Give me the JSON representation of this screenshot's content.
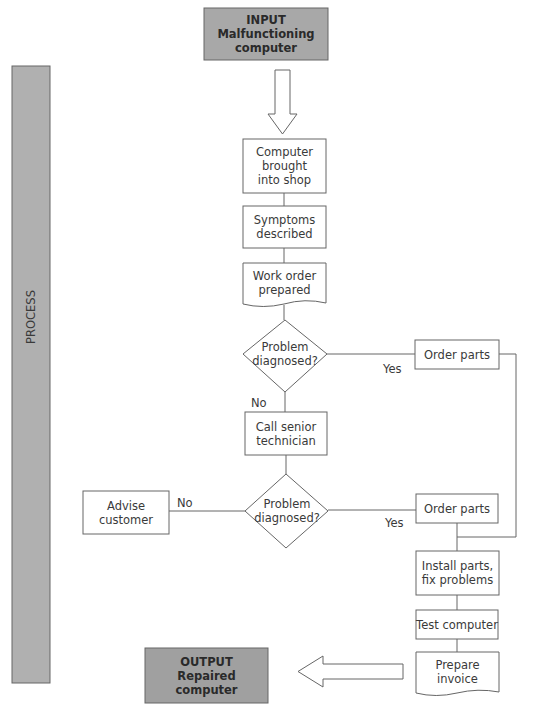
{
  "input": {
    "title": "INPUT",
    "subtitle": "Malfunctioning computer"
  },
  "process_label": "PROCESS",
  "output": {
    "title": "OUTPUT",
    "subtitle": "Repaired computer"
  },
  "steps": {
    "brought_in": "Computer brought into shop",
    "symptoms": "Symptoms described",
    "work_order": "Work order prepared",
    "decision1": "Problem diagnosed?",
    "order_parts1": "Order parts",
    "call_senior": "Call senior technician",
    "decision2": "Problem diagnosed?",
    "advise": "Advise customer",
    "order_parts2": "Order parts",
    "install": "Install parts, fix problems",
    "test": "Test computer",
    "invoice": "Prepare invoice"
  },
  "edges": {
    "d1_yes": "Yes",
    "d1_no": "No",
    "d2_no": "No",
    "d2_yes": "Yes"
  },
  "colors": {
    "gray_fill": "#a9a9a9",
    "stroke": "#555555"
  }
}
